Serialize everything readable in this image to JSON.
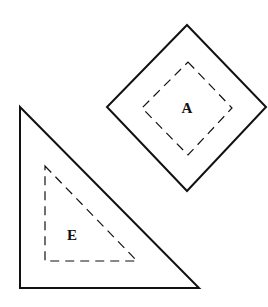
{
  "shapes": {
    "diamond": {
      "label": "A",
      "outer": [
        [
          187,
          25
        ],
        [
          266,
          107
        ],
        [
          187,
          191
        ],
        [
          107,
          107
        ]
      ],
      "inner": [
        [
          188,
          62
        ],
        [
          232,
          108
        ],
        [
          188,
          155
        ],
        [
          142,
          108
        ]
      ],
      "label_pos": [
        187,
        113
      ]
    },
    "triangle": {
      "label": "E",
      "outer": [
        [
          20,
          107
        ],
        [
          199,
          288
        ],
        [
          20,
          288
        ]
      ],
      "inner": [
        [
          45,
          166
        ],
        [
          137,
          261
        ],
        [
          45,
          261
        ]
      ],
      "label_pos": [
        72,
        240
      ]
    }
  },
  "colors": {
    "stroke": "#111111",
    "background": "#ffffff"
  }
}
